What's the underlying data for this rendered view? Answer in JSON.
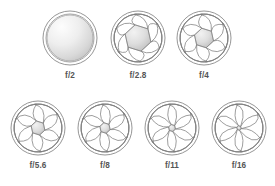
{
  "figure": {
    "background_color": "#ffffff",
    "stroke_color": "#8a8a8a",
    "label_color": "#555555",
    "blade_count": 6
  },
  "apertures": [
    {
      "id": "f2",
      "label": "f/2",
      "cx": 70,
      "cy": 38,
      "r_outer": 27,
      "r_inner": 24,
      "opening_radius": 23.0,
      "blades_visible": false,
      "row": 1
    },
    {
      "id": "f28",
      "label": "f/2.8",
      "cx": 138,
      "cy": 38,
      "r_outer": 27,
      "r_inner": 24,
      "opening_radius": 13.5,
      "blades_visible": true,
      "row": 1
    },
    {
      "id": "f4",
      "label": "f/4",
      "cx": 204,
      "cy": 38,
      "r_outer": 27,
      "r_inner": 24,
      "opening_radius": 10.0,
      "blades_visible": true,
      "row": 1
    },
    {
      "id": "f56",
      "label": "f/5.6",
      "cx": 38,
      "cy": 128,
      "r_outer": 27,
      "r_inner": 24,
      "opening_radius": 7.2,
      "blades_visible": true,
      "row": 2
    },
    {
      "id": "f8",
      "label": "f/8",
      "cx": 105,
      "cy": 128,
      "r_outer": 27,
      "r_inner": 24,
      "opening_radius": 5.4,
      "blades_visible": true,
      "row": 2
    },
    {
      "id": "f11",
      "label": "f/11",
      "cx": 172,
      "cy": 128,
      "r_outer": 27,
      "r_inner": 24,
      "opening_radius": 3.6,
      "blades_visible": true,
      "row": 2
    },
    {
      "id": "f16",
      "label": "f/16",
      "cx": 239,
      "cy": 128,
      "r_outer": 27,
      "r_inner": 24,
      "opening_radius": 2.3,
      "blades_visible": true,
      "row": 2
    }
  ],
  "label_offsets": {
    "row1_y": 78,
    "row2_y": 168
  }
}
